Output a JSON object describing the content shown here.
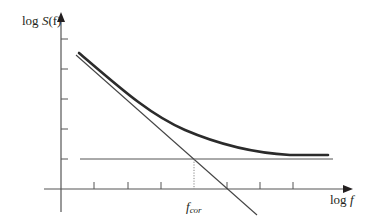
{
  "diagram": {
    "type": "log-log noise spectrum (1/f corner)",
    "y_axis": {
      "label_prefix": "log ",
      "label_main": "S",
      "label_arg": "(f)",
      "ticks": 5
    },
    "x_axis": {
      "label_prefix": "log ",
      "label_var": "f",
      "ticks": 7
    },
    "corner_label": {
      "main": "f",
      "sub": "cor"
    },
    "colors": {
      "ink": "#231f20",
      "axis": "#555555",
      "curve": "#2b2b2b"
    },
    "elements": [
      {
        "name": "total-noise-curve",
        "desc": "thick curve: 1/f slope at low f flattening to white-noise floor"
      },
      {
        "name": "flicker-asymptote",
        "desc": "thin straight line with negative slope (1/f noise)"
      },
      {
        "name": "white-noise-floor",
        "desc": "thin horizontal line (white noise level)"
      },
      {
        "name": "corner-marker",
        "desc": "dotted vertical line at intersection, labelled f_cor"
      }
    ]
  }
}
